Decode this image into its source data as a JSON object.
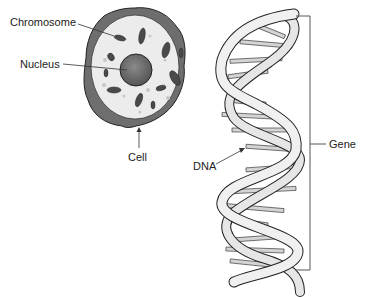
{
  "diagram": {
    "labels": {
      "chromosome": "Chromosome",
      "nucleus": "Nucleus",
      "cell": "Cell",
      "dna": "DNA",
      "gene": "Gene"
    },
    "colors": {
      "cell_membrane": "#6e6e6e",
      "cytoplasm": "#ececec",
      "nucleus": "#666666",
      "chromosome": "#4a4a4a",
      "dna_strand": "#e8e8e8",
      "dna_outline": "#222222",
      "line": "#333333"
    }
  }
}
